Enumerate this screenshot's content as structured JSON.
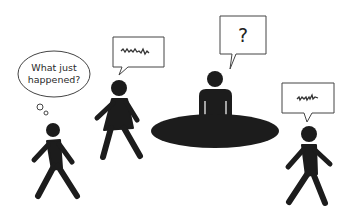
{
  "illustration": {
    "description": "Office scene: a person seated at an oval table with three walking people and speech/thought bubbles",
    "colors": {
      "figure": "#1c1c1c",
      "outline": "#444444",
      "background": "#ffffff"
    },
    "thought_bubble": {
      "line1": "What just",
      "line2": "happened?"
    },
    "speech_bubble_woman": {
      "content": "scribble"
    },
    "speech_bubble_seated": {
      "text": "?"
    },
    "speech_bubble_right": {
      "content": "scribble"
    },
    "figures": [
      {
        "name": "walking-man-left",
        "icon": "pedestrian-icon"
      },
      {
        "name": "walking-woman",
        "icon": "woman-walking-icon"
      },
      {
        "name": "seated-person",
        "icon": "person-seated-icon"
      },
      {
        "name": "walking-man-right",
        "icon": "pedestrian-icon"
      }
    ],
    "table": {
      "shape": "ellipse"
    }
  }
}
